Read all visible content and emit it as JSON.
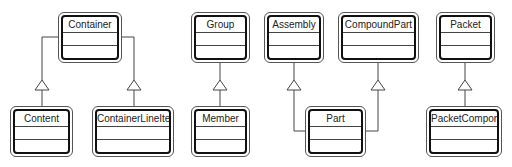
{
  "diagram": {
    "type": "uml-class-generalization",
    "colors": {
      "line": "#444444",
      "box_border": "#111111",
      "background": "#ffffff"
    },
    "classes": [
      {
        "id": "container",
        "name": "Container",
        "x": 58,
        "y": 12,
        "w": 64,
        "h": 51
      },
      {
        "id": "content",
        "name": "Content",
        "x": 10,
        "y": 106,
        "w": 63,
        "h": 51
      },
      {
        "id": "container_line_item",
        "name": "ContainerLineItem",
        "x": 92,
        "y": 106,
        "w": 82,
        "h": 51
      },
      {
        "id": "group",
        "name": "Group",
        "x": 191,
        "y": 12,
        "w": 59,
        "h": 51
      },
      {
        "id": "member",
        "name": "Member",
        "x": 191,
        "y": 106,
        "w": 59,
        "h": 51
      },
      {
        "id": "assembly",
        "name": "Assembly",
        "x": 264,
        "y": 12,
        "w": 60,
        "h": 51
      },
      {
        "id": "compound_part",
        "name": "CompoundPart",
        "x": 338,
        "y": 12,
        "w": 81,
        "h": 51
      },
      {
        "id": "part",
        "name": "Part",
        "x": 305,
        "y": 106,
        "w": 61,
        "h": 51
      },
      {
        "id": "packet",
        "name": "Packet",
        "x": 436,
        "y": 12,
        "w": 59,
        "h": 51
      },
      {
        "id": "packet_component",
        "name": "PacketComponent",
        "x": 426,
        "y": 106,
        "w": 76,
        "h": 51
      }
    ],
    "generalizations": [
      {
        "child": "Content",
        "parent": "Container"
      },
      {
        "child": "ContainerLineItem",
        "parent": "Container"
      },
      {
        "child": "Member",
        "parent": "Group"
      },
      {
        "child": "Part",
        "parent": "Assembly"
      },
      {
        "child": "Part",
        "parent": "CompoundPart"
      },
      {
        "child": "PacketComponent",
        "parent": "Packet"
      }
    ]
  }
}
